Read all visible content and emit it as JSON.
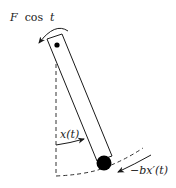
{
  "diagram": {
    "labels": {
      "applied_force_symbol": "F",
      "applied_force_func": "cos",
      "applied_force_var": "t",
      "angle": "x(t)",
      "damping": "−bx′(t)"
    },
    "elements": [
      {
        "name": "pendulum-rod",
        "kind": "rectangle-outline"
      },
      {
        "name": "pivot-point",
        "kind": "dot"
      },
      {
        "name": "bob-mass",
        "kind": "filled-circle"
      },
      {
        "name": "vertical-reference",
        "kind": "dashed-line"
      },
      {
        "name": "bob-path",
        "kind": "dashed-arc"
      },
      {
        "name": "applied-torque-arrow",
        "kind": "curved-arrow",
        "direction": "counterclockwise"
      },
      {
        "name": "angle-arrow",
        "kind": "curved-arrow"
      },
      {
        "name": "damping-force-arrow",
        "kind": "curved-arrow"
      }
    ],
    "colors": {
      "stroke": "#1a1a1a",
      "fill": "#000000",
      "background": "#ffffff"
    }
  }
}
